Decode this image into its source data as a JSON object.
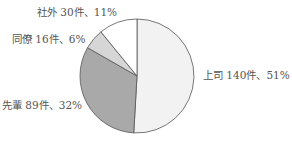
{
  "chart_data": {
    "type": "pie",
    "title": "",
    "start_angle_deg": 0,
    "direction": "clockwise",
    "total": 275,
    "slices": [
      {
        "label": "上司",
        "count": 140,
        "unit": "件",
        "percent": 51,
        "color": "#f2f2f2",
        "text": "上司 140件、51%"
      },
      {
        "label": "先輩",
        "count": 89,
        "unit": "件",
        "percent": 32,
        "color": "#a9a9a9",
        "text": "先輩 89件、32%"
      },
      {
        "label": "同僚",
        "count": 16,
        "unit": "件",
        "percent": 6,
        "color": "#d6d6d6",
        "text": "同僚 16件、6%"
      },
      {
        "label": "社外",
        "count": 30,
        "unit": "件",
        "percent": 11,
        "color": "#ffffff",
        "text": "社外 30件、11%"
      }
    ],
    "stroke_color": "#555555",
    "legend": "none (data labels beside slices)"
  }
}
